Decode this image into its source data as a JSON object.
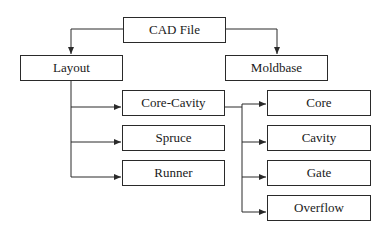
{
  "diagram": {
    "type": "hierarchy-flowchart",
    "nodes": [
      {
        "id": "cad_file",
        "label": "CAD File",
        "x": 123,
        "y": 17,
        "w": 103,
        "h": 26
      },
      {
        "id": "layout",
        "label": "Layout",
        "x": 20,
        "y": 55,
        "w": 103,
        "h": 26
      },
      {
        "id": "moldbase",
        "label": "Moldbase",
        "x": 225,
        "y": 55,
        "w": 103,
        "h": 26
      },
      {
        "id": "core_cavity",
        "label": "Core-Cavity",
        "x": 122,
        "y": 90,
        "w": 103,
        "h": 26
      },
      {
        "id": "spruce",
        "label": "Spruce",
        "x": 122,
        "y": 125,
        "w": 103,
        "h": 26
      },
      {
        "id": "runner",
        "label": "Runner",
        "x": 122,
        "y": 160,
        "w": 103,
        "h": 26
      },
      {
        "id": "core",
        "label": "Core",
        "x": 267,
        "y": 90,
        "w": 104,
        "h": 26
      },
      {
        "id": "cavity",
        "label": "Cavity",
        "x": 267,
        "y": 125,
        "w": 104,
        "h": 26
      },
      {
        "id": "gate",
        "label": "Gate",
        "x": 267,
        "y": 160,
        "w": 104,
        "h": 26
      },
      {
        "id": "overflow",
        "label": "Overflow",
        "x": 267,
        "y": 195,
        "w": 104,
        "h": 26
      }
    ],
    "edges": [
      {
        "from": "cad_file",
        "to": "layout"
      },
      {
        "from": "cad_file",
        "to": "moldbase"
      },
      {
        "from": "layout",
        "to": "core_cavity"
      },
      {
        "from": "layout",
        "to": "spruce"
      },
      {
        "from": "layout",
        "to": "runner"
      },
      {
        "from": "core_cavity",
        "to": "core"
      },
      {
        "from": "core_cavity",
        "to": "cavity"
      },
      {
        "from": "core_cavity",
        "to": "gate"
      },
      {
        "from": "core_cavity",
        "to": "overflow"
      }
    ],
    "colors": {
      "line": "#2a2a2a",
      "text": "#1a1a1a",
      "background": "#ffffff"
    }
  }
}
